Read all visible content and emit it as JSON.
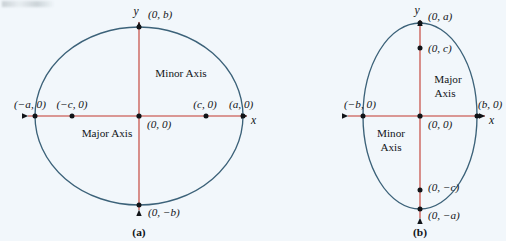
{
  "figure": {
    "background_color": "#f2f7fb",
    "ellipse_color": "#3c6279",
    "axis_color": "#c2392e",
    "point_color": "#111418",
    "text_color": "#111418"
  },
  "panel_a": {
    "caption": "(a)",
    "x_axis_name": "x",
    "y_axis_name": "y",
    "major_axis_label": "Major Axis",
    "minor_axis_label": "Minor Axis",
    "labels": {
      "top_vertex": "(0, b)",
      "bottom_vertex": "(0, −b)",
      "left_vertex": "(−a, 0)",
      "right_vertex": "(a, 0)",
      "left_focus": "(−c, 0)",
      "right_focus": "(c, 0)",
      "center": "(0, 0)"
    }
  },
  "panel_b": {
    "caption": "(b)",
    "x_axis_name": "x",
    "y_axis_name": "y",
    "major_axis_label_line1": "Major",
    "major_axis_label_line2": "Axis",
    "minor_axis_label_line1": "Minor",
    "minor_axis_label_line2": "Axis",
    "labels": {
      "top_vertex": "(0, a)",
      "bottom_vertex": "(0, −a)",
      "left_vertex": "(−b, 0)",
      "right_vertex": "(b, 0)",
      "upper_focus": "(0, c)",
      "lower_focus": "(0, −c)",
      "center": "(0, 0)"
    }
  }
}
